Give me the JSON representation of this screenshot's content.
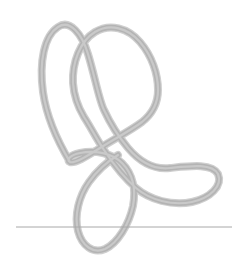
{
  "figure": {
    "canvas": {
      "width": 245,
      "height": 276,
      "background": "#ffffff"
    },
    "baseline": {
      "name": "horizontal baseline",
      "x1": 16,
      "y1": 227,
      "x2": 232,
      "y2": 227,
      "color": "#a8a8a8",
      "width": 1
    },
    "curve": {
      "name": "continuous four-loop scribble",
      "color": "#b4b4b4",
      "highlight_color": "#c9c9c9",
      "stroke_width": 6,
      "loop_count": 4,
      "loops": [
        {
          "label": "upper-left loop",
          "center_x": 78,
          "center_y": 68,
          "tip_x": 55,
          "tip_y": 26
        },
        {
          "label": "upper-right loop",
          "center_x": 148,
          "center_y": 66,
          "tip_x": 145,
          "tip_y": 30
        },
        {
          "label": "right teardrop loop",
          "center_x": 178,
          "center_y": 175,
          "tip_x": 218,
          "tip_y": 172
        },
        {
          "label": "bottom loop",
          "center_x": 108,
          "center_y": 212,
          "tip_x": 105,
          "tip_y": 250
        }
      ],
      "crossing_x": 100,
      "crossing_y": 107,
      "cusp_x": 70,
      "cusp_y": 160,
      "path": "M 70 162 C 61 147 47 120 43 92 C 39 62 44 36 58 27 C 70 19 82 34 88 54 C 95 77 99 100 104 110 C 110 123 118 136 128 148 C 139 161 153 170 170 168 C 190 166 212 163 218 174 C 223 186 210 198 192 202 C 172 206 150 200 136 188 C 122 176 112 162 104 150 C 96 138 90 126 84 117 C 78 107 74 97 73 83 C 72 63 80 41 95 32 C 110 23 128 28 140 42 C 152 56 158 74 158 90 C 158 104 152 114 142 122 C 130 131 114 139 100 148 C 86 157 74 164 70 162 C 66 160 70 155 80 153 C 95 150 112 153 122 163 C 133 174 136 190 133 206 C 129 224 118 243 105 249 C 93 254 82 246 78 231 C 74 215 79 196 89 182 C 99 168 110 160 118 155"
    }
  }
}
